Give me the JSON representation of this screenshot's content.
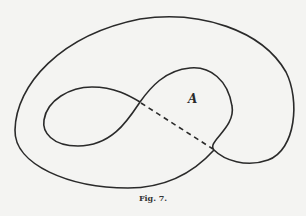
{
  "figure": {
    "region_label": "A",
    "caption": "Fig. 7.",
    "stroke_color": "#2a2a2a",
    "background_color": "#f4f4f2"
  }
}
